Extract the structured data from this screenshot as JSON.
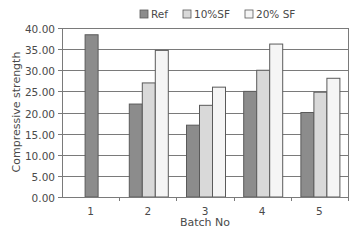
{
  "chart_data": {
    "type": "bar",
    "title": "",
    "xlabel": "Batch No",
    "ylabel": "Compressive strength",
    "categories": [
      "1",
      "2",
      "3",
      "4",
      "5"
    ],
    "series": [
      {
        "name": "Ref",
        "color": "#8c8c8c",
        "values": [
          38.4,
          22.0,
          17.0,
          25.0,
          20.0
        ]
      },
      {
        "name": "10%SF",
        "color": "#d9d9d9",
        "values": [
          null,
          27.0,
          21.7,
          30.0,
          24.8
        ]
      },
      {
        "name": "20% SF",
        "color": "#f5f5f5",
        "values": [
          null,
          34.7,
          26.0,
          36.2,
          28.1
        ]
      }
    ],
    "ylim": [
      0,
      40
    ],
    "yticks": [
      "0.00",
      "5.00",
      "10.00",
      "15.00",
      "20.00",
      "25.00",
      "30.00",
      "35.00",
      "40.00"
    ],
    "grid": true,
    "legend_position": "top"
  },
  "colors": {
    "bar_outline": "#5a5a5a",
    "grid": "#7a7a7a",
    "axis": "#7a7a7a"
  }
}
